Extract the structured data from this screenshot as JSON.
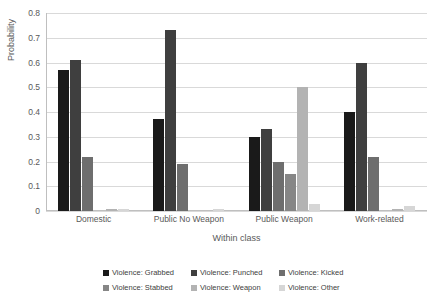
{
  "chart_data": {
    "type": "bar",
    "title": "",
    "xlabel": "Within class",
    "ylabel": "Probability",
    "ylim": [
      0,
      0.8
    ],
    "ytick_labels": [
      "0.8",
      "0.7",
      "0.6",
      "0.5",
      "0.4",
      "0.3",
      "0.2",
      "0.1",
      "0"
    ],
    "ytick_values": [
      0.8,
      0.7,
      0.6,
      0.5,
      0.4,
      0.3,
      0.2,
      0.1,
      0
    ],
    "grid": true,
    "legend_position": "bottom",
    "categories": [
      "Domestic",
      "Public No Weapon",
      "Public Weapon",
      "Work-related"
    ],
    "series": [
      {
        "name": "Violence: Grabbed",
        "color": "#1a1a1a",
        "values": [
          0.57,
          0.37,
          0.3,
          0.4
        ]
      },
      {
        "name": "Violence: Punched",
        "color": "#3f3f3f",
        "values": [
          0.61,
          0.73,
          0.33,
          0.6
        ]
      },
      {
        "name": "Violence: Kicked",
        "color": "#6e6e6e",
        "values": [
          0.22,
          0.19,
          0.2,
          0.22
        ]
      },
      {
        "name": "Violence: Stabbed",
        "color": "#868686",
        "values": [
          0.0,
          0.0,
          0.15,
          0.0
        ]
      },
      {
        "name": "Violence: Weapon",
        "color": "#b3b3b3",
        "values": [
          0.01,
          0.0,
          0.5,
          0.01
        ]
      },
      {
        "name": "Violence: Other",
        "color": "#d6d6d6",
        "values": [
          0.01,
          0.01,
          0.03,
          0.02
        ]
      }
    ]
  }
}
